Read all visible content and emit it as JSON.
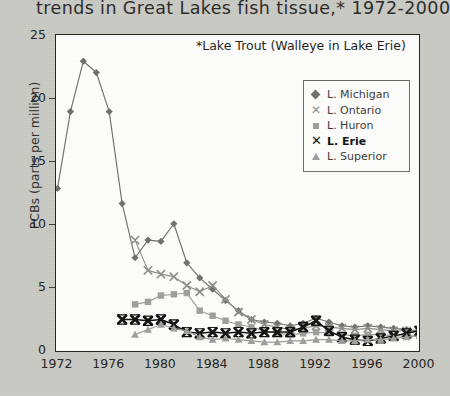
{
  "title": "trends in Great Lakes fish tissue,* 1972-2000",
  "bottom_caption": "",
  "annotation": "*Lake Trout (Walleye in Lake Erie)",
  "axes": {
    "ylabel": "PCBs (parts per million)",
    "yticks": [
      "0",
      "5",
      "10",
      "15",
      "20",
      "25"
    ],
    "xticks": [
      "1972",
      "1976",
      "1980",
      "1984",
      "1988",
      "1992",
      "1996",
      "2000"
    ]
  },
  "legend": {
    "items": [
      {
        "label": "L. Michigan",
        "marker": "diamond",
        "color": "#6f6f6d"
      },
      {
        "label": "L. Ontario",
        "marker": "x",
        "color": "#8d8d8a"
      },
      {
        "label": "L. Huron",
        "marker": "square",
        "color": "#9d9d9a"
      },
      {
        "label": "L. Erie",
        "marker": "x-bold",
        "color": "#111111"
      },
      {
        "label": "L. Superior",
        "marker": "triangle",
        "color": "#9d9d9a"
      }
    ]
  },
  "chart_data": {
    "type": "line",
    "title": "trends in Great Lakes fish tissue,* 1972-2000",
    "xlabel": "",
    "ylabel": "PCBs (parts per million)",
    "xlim": [
      1972,
      2000
    ],
    "ylim": [
      0,
      25
    ],
    "grid": false,
    "legend_position": "top-right-inside",
    "annotations": [
      "*Lake Trout (Walleye in Lake Erie)"
    ],
    "series": [
      {
        "name": "L. Michigan",
        "marker": "diamond",
        "color": "#6f6f6d",
        "x": [
          1972,
          1973,
          1974,
          1975,
          1976,
          1977,
          1978,
          1979,
          1980,
          1981,
          1982,
          1983,
          1984,
          1985,
          1986,
          1987,
          1988,
          1989,
          1990,
          1991,
          1992,
          1993,
          1994,
          1995,
          1996,
          1997,
          1998,
          1999,
          2000
        ],
        "y": [
          12.9,
          19.0,
          23.0,
          22.1,
          19.0,
          11.7,
          7.4,
          8.8,
          8.7,
          10.1,
          7.0,
          5.8,
          4.9,
          4.0,
          3.2,
          2.5,
          2.3,
          2.2,
          2.0,
          2.2,
          2.6,
          2.3,
          2.0,
          1.9,
          2.0,
          1.9,
          1.8,
          1.7,
          1.6
        ]
      },
      {
        "name": "L. Ontario",
        "marker": "x",
        "color": "#8d8d8a",
        "x": [
          1978,
          1979,
          1980,
          1981,
          1982,
          1983,
          1984,
          1985,
          1986,
          1987,
          1988,
          1989,
          1990,
          1991,
          1992,
          1993,
          1994,
          1995,
          1996,
          1997,
          1998,
          1999,
          2000
        ],
        "y": [
          8.8,
          6.4,
          6.1,
          5.9,
          5.2,
          4.7,
          5.2,
          4.1,
          3.1,
          2.5,
          2.1,
          1.9,
          1.7,
          1.8,
          2.0,
          1.9,
          1.8,
          1.7,
          1.8,
          1.7,
          1.6,
          1.6,
          1.5
        ]
      },
      {
        "name": "L. Huron",
        "marker": "square",
        "color": "#9d9d9a",
        "x": [
          1978,
          1979,
          1980,
          1981,
          1982,
          1983,
          1984,
          1985,
          1986,
          1987,
          1988,
          1989,
          1990,
          1991,
          1992,
          1993,
          1994,
          1995,
          1996,
          1997,
          1998,
          1999,
          2000
        ],
        "y": [
          3.7,
          3.9,
          4.4,
          4.5,
          4.6,
          3.2,
          2.8,
          2.4,
          2.1,
          1.9,
          1.6,
          1.4,
          1.3,
          1.4,
          1.5,
          1.4,
          1.3,
          1.2,
          1.3,
          1.3,
          1.2,
          1.2,
          1.2
        ]
      },
      {
        "name": "L. Erie",
        "marker": "x-bold",
        "color": "#111111",
        "x": [
          1977,
          1978,
          1979,
          1980,
          1981,
          1982,
          1983,
          1984,
          1985,
          1986,
          1987,
          1988,
          1989,
          1990,
          1991,
          1992,
          1993,
          1994,
          1995,
          1996,
          1997,
          1998,
          1999,
          2000
        ],
        "y": [
          2.5,
          2.5,
          2.4,
          2.5,
          2.1,
          1.5,
          1.4,
          1.5,
          1.4,
          1.5,
          1.4,
          1.5,
          1.5,
          1.5,
          1.9,
          2.4,
          1.6,
          1.1,
          0.9,
          0.8,
          1.0,
          1.2,
          1.4,
          1.6
        ]
      },
      {
        "name": "L. Superior",
        "marker": "triangle",
        "color": "#9d9d9a",
        "x": [
          1978,
          1979,
          1980,
          1981,
          1982,
          1983,
          1984,
          1985,
          1986,
          1987,
          1988,
          1989,
          1990,
          1991,
          1992,
          1993,
          1994,
          1995,
          1996,
          1997,
          1998,
          1999,
          2000
        ],
        "y": [
          1.3,
          1.7,
          2.1,
          1.8,
          1.6,
          1.1,
          0.9,
          1.0,
          0.9,
          0.8,
          0.7,
          0.7,
          0.8,
          0.8,
          0.9,
          0.9,
          0.8,
          0.8,
          0.9,
          0.9,
          1.0,
          1.1,
          1.2
        ]
      }
    ]
  }
}
